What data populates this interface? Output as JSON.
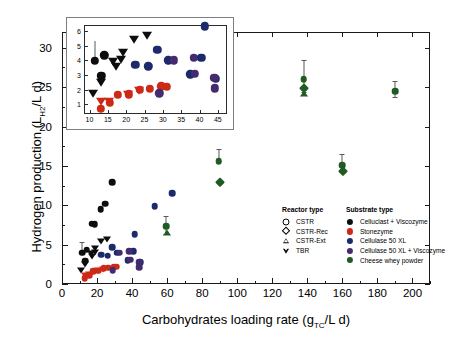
{
  "chart_data": {
    "type": "scatter",
    "title": "",
    "xlabel": "Carbohydrates loading rate (gTC/L d)",
    "ylabel": "Hydrogen production (LH2/L d)",
    "xlabel_parts": {
      "pre": "Carbohydrates loading rate (g",
      "sub": "TC",
      "post": "/L d)"
    },
    "ylabel_parts": {
      "pre": "Hydrogen production (L",
      "sub": "H2",
      "post": "/L d)"
    },
    "xlim": [
      0,
      210
    ],
    "ylim": [
      0,
      32
    ],
    "xticks": [
      0,
      20,
      40,
      60,
      80,
      100,
      120,
      140,
      160,
      180,
      200
    ],
    "yticks": [
      0,
      5,
      10,
      15,
      20,
      25,
      30
    ],
    "grid": false,
    "series": [
      {
        "name": "Cellulast + Viscozyme",
        "substrate": "Celluclast + Viscozyme",
        "color": "#0d0d0d",
        "points": [
          {
            "x": 11.5,
            "y": 3.95,
            "marker": "circle",
            "yerr_up": 1.35,
            "yerr_dn": 0.0
          },
          {
            "x": 14.0,
            "y": 4.35,
            "marker": "circle"
          },
          {
            "x": 13.2,
            "y": 2.95,
            "marker": "circle"
          },
          {
            "x": 17.0,
            "y": 7.65,
            "marker": "circle"
          },
          {
            "x": 18.6,
            "y": 7.6,
            "marker": "circle"
          },
          {
            "x": 22.0,
            "y": 9.5,
            "marker": "circle"
          },
          {
            "x": 24.5,
            "y": 10.2,
            "marker": "circle"
          },
          {
            "x": 28.8,
            "y": 12.9,
            "marker": "circle"
          },
          {
            "x": 11.0,
            "y": 1.75,
            "marker": "tdown"
          },
          {
            "x": 13.0,
            "y": 2.55,
            "marker": "tdown"
          },
          {
            "x": 17.2,
            "y": 3.6,
            "marker": "tdown"
          },
          {
            "x": 18.6,
            "y": 4.1,
            "marker": "tdown"
          },
          {
            "x": 22.2,
            "y": 5.45,
            "marker": "tdown"
          },
          {
            "x": 25.8,
            "y": 5.75,
            "marker": "tdown"
          },
          {
            "x": 19.0,
            "y": 4.55,
            "marker": "tdown"
          },
          {
            "x": 16.5,
            "y": 3.95,
            "marker": "tdown"
          }
        ]
      },
      {
        "name": "Stonezyme",
        "substrate": "Stonezyme",
        "color": "#cc2a17",
        "points": [
          {
            "x": 13.0,
            "y": 0.7,
            "marker": "circle"
          },
          {
            "x": 15.6,
            "y": 1.1,
            "marker": "circle"
          },
          {
            "x": 17.8,
            "y": 1.65,
            "marker": "circle"
          },
          {
            "x": 20.8,
            "y": 1.7,
            "marker": "circle"
          },
          {
            "x": 23.8,
            "y": 1.98,
            "marker": "circle"
          },
          {
            "x": 29.6,
            "y": 2.22,
            "marker": "circle"
          },
          {
            "x": 13.2,
            "y": 1.2,
            "marker": "tdown"
          },
          {
            "x": 15.4,
            "y": 1.25,
            "marker": "tdown"
          },
          {
            "x": 20.6,
            "y": 1.72,
            "marker": "tdown"
          },
          {
            "x": 23.6,
            "y": 1.95,
            "marker": "tdown"
          },
          {
            "x": 26.5,
            "y": 2.05,
            "marker": "circle"
          },
          {
            "x": 31.0,
            "y": 2.2,
            "marker": "circle"
          }
        ]
      },
      {
        "name": "Cellulase 50 XL",
        "substrate": "Cellulase 50 XL",
        "color": "#1c2a6b",
        "points": [
          {
            "x": 28.5,
            "y": 4.7,
            "marker": "circle"
          },
          {
            "x": 22.5,
            "y": 3.7,
            "marker": "circle"
          },
          {
            "x": 31.5,
            "y": 4.0,
            "marker": "circle"
          },
          {
            "x": 37.5,
            "y": 3.05,
            "marker": "circle"
          },
          {
            "x": 41.5,
            "y": 6.3,
            "marker": "circle"
          },
          {
            "x": 40.5,
            "y": 4.15,
            "marker": "circle"
          },
          {
            "x": 52.8,
            "y": 9.9,
            "marker": "circle"
          },
          {
            "x": 63.0,
            "y": 11.5,
            "marker": "circle"
          },
          {
            "x": 44.5,
            "y": 2.75,
            "marker": "circle"
          },
          {
            "x": 26.0,
            "y": 3.6,
            "marker": "circle"
          }
        ]
      },
      {
        "name": "Cellulase 50 XL + Viscozyme",
        "substrate": "Cellulase 50 XL + Viscozyme",
        "color": "#442a6e",
        "points": [
          {
            "x": 33.0,
            "y": 4.0,
            "marker": "circle"
          },
          {
            "x": 38.5,
            "y": 4.15,
            "marker": "circle"
          },
          {
            "x": 38.8,
            "y": 3.1,
            "marker": "circle"
          },
          {
            "x": 44.0,
            "y": 2.8,
            "marker": "circle"
          },
          {
            "x": 44.2,
            "y": 2.1,
            "marker": "circle"
          },
          {
            "x": 29.0,
            "y": 1.75,
            "marker": "circle"
          }
        ]
      },
      {
        "name": "Cheese whey powder",
        "substrate": "Cheese whey powder",
        "color": "#1f5b23",
        "points": [
          {
            "x": 59.5,
            "y": 7.35,
            "marker": "circle",
            "yerr_up": 1.25,
            "yerr_dn": 1.0
          },
          {
            "x": 59.8,
            "y": 6.5,
            "marker": "tup"
          },
          {
            "x": 89.5,
            "y": 15.6,
            "marker": "circle",
            "yerr_up": 1.6,
            "yerr_dn": 0.0
          },
          {
            "x": 90.0,
            "y": 13.0,
            "marker": "diamond"
          },
          {
            "x": 138.0,
            "y": 26.0,
            "marker": "circle",
            "yerr_up": 2.5,
            "yerr_dn": 1.6
          },
          {
            "x": 138.0,
            "y": 24.9,
            "marker": "diamond"
          },
          {
            "x": 138.3,
            "y": 24.1,
            "marker": "tup"
          },
          {
            "x": 160.0,
            "y": 15.05,
            "marker": "circle",
            "yerr_up": 1.5,
            "yerr_dn": 0.8
          },
          {
            "x": 160.2,
            "y": 14.3,
            "marker": "diamond"
          },
          {
            "x": 190.0,
            "y": 24.5,
            "marker": "circle",
            "yerr_up": 1.3,
            "yerr_dn": 0.7
          }
        ]
      }
    ],
    "inset": {
      "xlim": [
        8.5,
        47.5
      ],
      "ylim": [
        0.35,
        6.4
      ],
      "xticks": [
        10,
        15,
        20,
        25,
        30,
        35,
        40,
        45
      ],
      "yticks": [
        1,
        2,
        3,
        4,
        5,
        6
      ],
      "note": "Zoom of the low-loading-rate region of the main panel"
    }
  },
  "legend": {
    "reactor": {
      "title": "Reactor type",
      "items": [
        {
          "label": "CSTR",
          "marker": "circle-open"
        },
        {
          "label": "CSTR-Rec",
          "marker": "diamond-open"
        },
        {
          "label": "CSTR-Ext",
          "marker": "triangle-up-open"
        },
        {
          "label": "TBR",
          "marker": "triangle-down-open"
        }
      ]
    },
    "substrate": {
      "title": "Substrate type",
      "items": [
        {
          "label": "Celluclast + Viscozyme",
          "color": "#0d0d0d"
        },
        {
          "label": "Stonezyme",
          "color": "#cc2a17"
        },
        {
          "label": "Cellulase 50 XL",
          "color": "#1c2a6b"
        },
        {
          "label": "Cellulase 50 XL + Viscozyme",
          "color": "#442a6e"
        },
        {
          "label": "Cheese whey powder",
          "color": "#1f5b23"
        }
      ]
    }
  }
}
